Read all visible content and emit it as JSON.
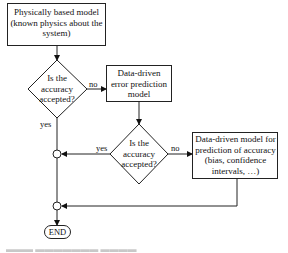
{
  "nodes": {
    "physical_model": {
      "line1": "Physically based model",
      "line2": "(known physics about the",
      "line3": "system)"
    },
    "decision_1": {
      "line1": "Is the",
      "line2": "accuracy",
      "line3": "accepted?"
    },
    "error_model": {
      "line1": "Data-driven",
      "line2": "error prediction",
      "line3": "model"
    },
    "decision_2": {
      "line1": "Is the",
      "line2": "accuracy",
      "line3": "accepted?"
    },
    "accuracy_model": {
      "line1": "Data-driven model for",
      "line2": "prediction of accuracy",
      "line3": "(bias, confidence",
      "line4": "intervals, …)"
    },
    "end": {
      "label": "END"
    }
  },
  "edges": {
    "d1_no": "no",
    "d1_yes": "yes",
    "d2_no": "no",
    "d2_yes": "yes"
  },
  "colors": {
    "stroke": "#222222",
    "background": "#ffffff"
  }
}
